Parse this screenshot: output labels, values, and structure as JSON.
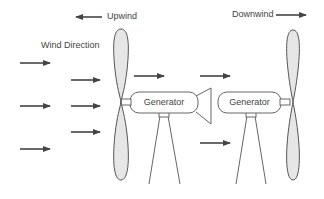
{
  "labels": {
    "upwind": "Upwind",
    "downwind": "Downwind",
    "wind_direction": "Wind Direction"
  },
  "turbines": [
    {
      "name": "upwind-turbine",
      "generator_label": "Generator",
      "has_tail_fin": true
    },
    {
      "name": "downwind-turbine",
      "generator_label": "Generator",
      "has_tail_fin": false
    }
  ],
  "colors": {
    "stroke": "#555555",
    "blade_fill": "#e6e6e6",
    "arrow": "#444444",
    "text": "#444444"
  }
}
